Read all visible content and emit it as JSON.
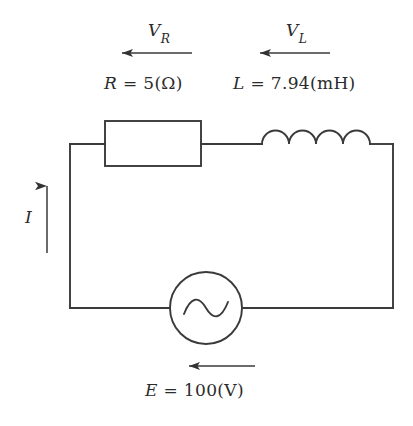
{
  "diagram": {
    "background_color": "#ffffff",
    "line_color": "#3a3a3a",
    "text_color": "#2b2b2b"
  },
  "labels": {
    "voltage_resistor": {
      "symbol": "V",
      "subscript": "R",
      "text": "V_R"
    },
    "voltage_inductor": {
      "symbol": "V",
      "subscript": "L",
      "text": "V_L"
    },
    "current": {
      "symbol": "I",
      "text": "I"
    },
    "resistor_value": {
      "symbol": "R",
      "equals": "=",
      "value": "5",
      "unit": "(Ω)",
      "text": "R = 5(Ω)"
    },
    "inductor_value": {
      "symbol": "L",
      "equals": "=",
      "value": "7.94",
      "unit": "(mH)",
      "text": "L = 7.94(mH)"
    },
    "source_value": {
      "symbol": "E",
      "equals": "=",
      "value": "100",
      "unit": "(V)",
      "text": "E = 100(V)"
    }
  },
  "components": {
    "resistor": {
      "name": "resistor",
      "shape": "rectangle"
    },
    "inductor": {
      "name": "inductor",
      "shape": "coil",
      "humps": 4
    },
    "source": {
      "name": "ac-voltage-source",
      "shape": "circle-with-sine"
    }
  },
  "arrows": {
    "vr_arrow": {
      "direction": "left"
    },
    "vl_arrow": {
      "direction": "left"
    },
    "current_arrow": {
      "direction": "up"
    },
    "source_arrow": {
      "direction": "left"
    }
  }
}
